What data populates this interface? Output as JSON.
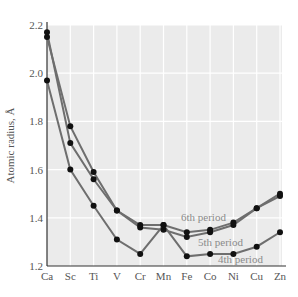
{
  "chart_data": {
    "type": "line",
    "title": "",
    "xlabel": "",
    "ylabel": "Atomic radius, Å",
    "ylim": [
      1.2,
      2.2
    ],
    "yticks": [
      1.2,
      1.4,
      1.6,
      1.8,
      2.0,
      2.2
    ],
    "ytick_labels": [
      "1.2",
      "1.4",
      "1.6",
      "1.8",
      "2.0",
      "2.2"
    ],
    "categories": [
      "Ca",
      "Sc",
      "Ti",
      "V",
      "Cr",
      "Mn",
      "Fe",
      "Co",
      "Ni",
      "Cu",
      "Zn"
    ],
    "grid": true,
    "legend_position": "inline labels near lines (lower right)",
    "series": [
      {
        "name": "4th period",
        "values": [
          1.97,
          1.6,
          1.45,
          1.31,
          1.25,
          1.37,
          1.24,
          1.25,
          1.25,
          1.28,
          1.34
        ]
      },
      {
        "name": "5th period",
        "values": [
          2.15,
          1.78,
          1.59,
          1.43,
          1.36,
          1.35,
          1.32,
          1.34,
          1.37,
          1.44,
          1.49
        ]
      },
      {
        "name": "6th period",
        "values": [
          2.17,
          1.71,
          1.56,
          1.43,
          1.37,
          1.37,
          1.34,
          1.35,
          1.38,
          1.44,
          1.5
        ]
      }
    ],
    "series_labels": [
      {
        "text": "6th period",
        "x": 181,
        "y": 221
      },
      {
        "text": "5th period",
        "x": 198,
        "y": 246
      },
      {
        "text": "4th period",
        "x": 218,
        "y": 263
      }
    ],
    "colors": {
      "plot_background": "#ebebeb",
      "grid": "#ffffff",
      "line": "#6e6e6e",
      "marker": "#111111",
      "axis": "#333333",
      "label": "#8a8a8a"
    }
  }
}
